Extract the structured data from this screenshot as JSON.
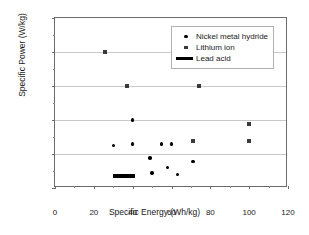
{
  "chart_data": {
    "type": "scatter",
    "title": "",
    "xlabel": "Specific Energy (Wh/kg)",
    "ylabel": "Specific Power (W/kg)",
    "xlim": [
      0,
      120
    ],
    "ylim": [
      0,
      2500
    ],
    "xticks": [
      0,
      20,
      40,
      60,
      80,
      100,
      120
    ],
    "yticks": [
      0,
      500,
      1000,
      1500,
      2000,
      2500
    ],
    "grid": true,
    "legend_position": "upper right",
    "series": [
      {
        "name": "Nickel metal hydride",
        "marker": "circle",
        "color": "#000000",
        "points": [
          {
            "x": 40,
            "y": 1000
          },
          {
            "x": 30,
            "y": 625
          },
          {
            "x": 40,
            "y": 645
          },
          {
            "x": 55,
            "y": 645
          },
          {
            "x": 60,
            "y": 645
          },
          {
            "x": 49,
            "y": 440
          },
          {
            "x": 71,
            "y": 390
          },
          {
            "x": 58,
            "y": 300
          },
          {
            "x": 50,
            "y": 220
          },
          {
            "x": 63,
            "y": 200
          }
        ]
      },
      {
        "name": "Lithium ion",
        "marker": "square",
        "color": "#3a3a3a",
        "points": [
          {
            "x": 26,
            "y": 2000
          },
          {
            "x": 37,
            "y": 1500
          },
          {
            "x": 74,
            "y": 1500
          },
          {
            "x": 100,
            "y": 940
          },
          {
            "x": 71,
            "y": 690
          },
          {
            "x": 100,
            "y": 690
          }
        ]
      },
      {
        "name": "Lead acid",
        "marker": "line",
        "color": "#000000",
        "bar": {
          "x_start": 30,
          "x_end": 41,
          "y": 180
        }
      }
    ]
  },
  "axis": {
    "y_tick_labels": [
      "0",
      "500",
      "1000",
      "1500",
      "2000",
      "2500"
    ],
    "x_tick_labels": [
      "0",
      "20",
      "40",
      "60",
      "80",
      "100",
      "120"
    ],
    "y_title": "Specific Power (W/kg)",
    "x_title": "Specific Energy (Wh/kg)"
  },
  "legend": {
    "items": [
      {
        "label": "Nickel metal hydride",
        "key": "dot-marker-icon"
      },
      {
        "label": "Lithium ion",
        "key": "square-marker-icon"
      },
      {
        "label": "Lead acid",
        "key": "line-marker-icon"
      }
    ]
  }
}
